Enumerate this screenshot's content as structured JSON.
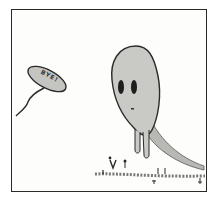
{
  "comic_panel": {
    "speech_bubble": {
      "text": "BYE!"
    },
    "colors": {
      "ink": "#2a2a2a",
      "ghost_fill": "#c9c9c6",
      "ghost_shade": "#a9a9a5",
      "bubble_fill": "#c4c4c0",
      "background": "#fdfdfc"
    }
  }
}
